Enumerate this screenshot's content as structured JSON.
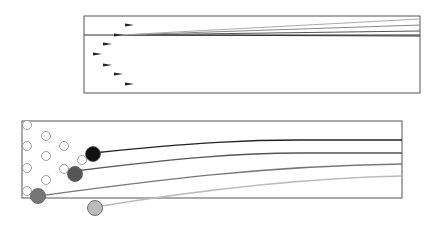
{
  "diagram": {
    "top_panel": {
      "box": {
        "x": 84,
        "y": 16,
        "w": 336,
        "h": 77
      },
      "arrows": [
        {
          "x": 125,
          "y": 25
        },
        {
          "x": 114,
          "y": 35
        },
        {
          "x": 103,
          "y": 44
        },
        {
          "x": 93,
          "y": 54
        },
        {
          "x": 103,
          "y": 65
        },
        {
          "x": 114,
          "y": 74
        },
        {
          "x": 125,
          "y": 84
        }
      ],
      "lines": [
        {
          "color": "#333333",
          "y_end": 36
        },
        {
          "color": "#555555",
          "y_end": 31
        },
        {
          "color": "#888888",
          "y_end": 25
        },
        {
          "color": "#aaaaaa",
          "y_end": 19
        }
      ]
    },
    "bottom_panel": {
      "box": {
        "x": 22,
        "y": 121,
        "w": 380,
        "h": 77
      },
      "empty_circles": [
        {
          "x": 27,
          "y": 125
        },
        {
          "x": 46,
          "y": 136
        },
        {
          "x": 27,
          "y": 146
        },
        {
          "x": 64,
          "y": 146
        },
        {
          "x": 46,
          "y": 156
        },
        {
          "x": 82,
          "y": 160
        },
        {
          "x": 27,
          "y": 168
        },
        {
          "x": 64,
          "y": 169
        },
        {
          "x": 46,
          "y": 180
        },
        {
          "x": 27,
          "y": 191
        }
      ],
      "filled_circles": [
        {
          "x": 93,
          "y": 154,
          "color": "#111111"
        },
        {
          "x": 75,
          "y": 174,
          "color": "#555555"
        },
        {
          "x": 38,
          "y": 196,
          "color": "#777777"
        },
        {
          "x": 95,
          "y": 208,
          "color": "#bbbbbb"
        }
      ],
      "curves": [
        {
          "color": "#222222",
          "d": "M93,153 C200,142 250,140 300,140 L402,140"
        },
        {
          "color": "#555555",
          "d": "M75,171 C180,158 240,153 300,153 L402,153"
        },
        {
          "color": "#777777",
          "d": "M38,196 C150,181 260,166 402,164"
        },
        {
          "color": "#bbbbbb",
          "d": "M95,207 C200,190 300,178 402,176"
        }
      ]
    }
  }
}
